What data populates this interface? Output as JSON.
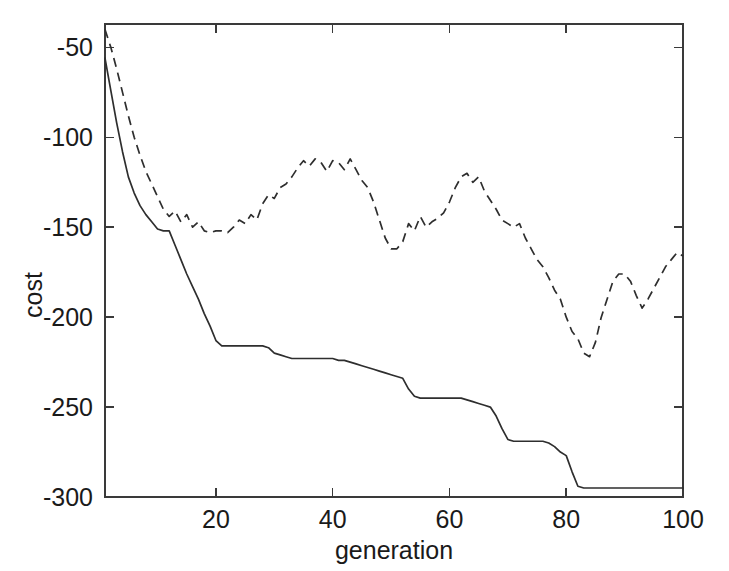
{
  "chart_data": {
    "type": "line",
    "title": "",
    "xlabel": "generation",
    "ylabel": "cost",
    "xlim": [
      1,
      100
    ],
    "ylim": [
      -300,
      -37
    ],
    "grid": false,
    "legend": "none",
    "xticks": [
      20,
      40,
      60,
      80,
      100
    ],
    "xticklabels": [
      "20",
      "40",
      "60",
      "80",
      "100"
    ],
    "yticks": [
      -50,
      -100,
      -150,
      -200,
      -250,
      -300
    ],
    "yticklabels": [
      "-50",
      "-100",
      "-150",
      "-200",
      "-250",
      "-300"
    ],
    "series": [
      {
        "name": "best cost",
        "style": "solid",
        "x": [
          1,
          2,
          3,
          4,
          5,
          6,
          7,
          8,
          9,
          10,
          11,
          12,
          13,
          14,
          15,
          16,
          17,
          18,
          19,
          20,
          21,
          22,
          23,
          24,
          25,
          26,
          27,
          28,
          29,
          30,
          31,
          32,
          33,
          34,
          35,
          36,
          37,
          38,
          39,
          40,
          41,
          42,
          43,
          44,
          45,
          46,
          47,
          48,
          49,
          50,
          51,
          52,
          53,
          54,
          55,
          56,
          57,
          58,
          59,
          60,
          61,
          62,
          63,
          64,
          65,
          66,
          67,
          68,
          69,
          70,
          71,
          72,
          73,
          74,
          75,
          76,
          77,
          78,
          79,
          80,
          81,
          82,
          83,
          84,
          85,
          86,
          87,
          88,
          89,
          90,
          91,
          92,
          93,
          94,
          95,
          96,
          97,
          98,
          99,
          100
        ],
        "y": [
          -56,
          -74,
          -92,
          -108,
          -122,
          -131,
          -138,
          -143,
          -147,
          -151,
          -152,
          -152,
          -160,
          -168,
          -176,
          -183,
          -190,
          -198,
          -205,
          -213,
          -216,
          -216,
          -216,
          -216,
          -216,
          -216,
          -216,
          -216,
          -217,
          -220,
          -221,
          -222,
          -223,
          -223,
          -223,
          -223,
          -223,
          -223,
          -223,
          -223,
          -224,
          -224,
          -225,
          -226,
          -227,
          -228,
          -229,
          -230,
          -231,
          -232,
          -233,
          -234,
          -240,
          -244,
          -245,
          -245,
          -245,
          -245,
          -245,
          -245,
          -245,
          -245,
          -246,
          -247,
          -248,
          -249,
          -250,
          -255,
          -262,
          -268,
          -269,
          -269,
          -269,
          -269,
          -269,
          -269,
          -270,
          -272,
          -275,
          -277,
          -286,
          -294,
          -295,
          -295,
          -295,
          -295,
          -295,
          -295,
          -295,
          -295,
          -295,
          -295,
          -295,
          -295,
          -295,
          -295,
          -295,
          -295,
          -295,
          -295
        ]
      },
      {
        "name": "average cost",
        "style": "dashed",
        "x": [
          1,
          2,
          3,
          4,
          5,
          6,
          7,
          8,
          9,
          10,
          11,
          12,
          13,
          14,
          15,
          16,
          17,
          18,
          19,
          20,
          21,
          22,
          23,
          24,
          25,
          26,
          27,
          28,
          29,
          30,
          31,
          32,
          33,
          34,
          35,
          36,
          37,
          38,
          39,
          40,
          41,
          42,
          43,
          44,
          45,
          46,
          47,
          48,
          49,
          50,
          51,
          52,
          53,
          54,
          55,
          56,
          57,
          58,
          59,
          60,
          61,
          62,
          63,
          64,
          65,
          66,
          67,
          68,
          69,
          70,
          71,
          72,
          73,
          74,
          75,
          76,
          77,
          78,
          79,
          80,
          81,
          82,
          83,
          84,
          85,
          86,
          87,
          88,
          89,
          90,
          91,
          92,
          93,
          94,
          95,
          96,
          97,
          98,
          99,
          100
        ],
        "y": [
          -40,
          -50,
          -62,
          -75,
          -88,
          -100,
          -110,
          -119,
          -126,
          -133,
          -140,
          -144,
          -141,
          -147,
          -143,
          -150,
          -147,
          -152,
          -153,
          -152,
          -152,
          -153,
          -150,
          -146,
          -148,
          -143,
          -146,
          -137,
          -132,
          -134,
          -128,
          -126,
          -122,
          -117,
          -113,
          -116,
          -112,
          -114,
          -119,
          -113,
          -114,
          -118,
          -112,
          -118,
          -124,
          -128,
          -136,
          -146,
          -156,
          -162,
          -162,
          -158,
          -148,
          -152,
          -144,
          -150,
          -147,
          -145,
          -142,
          -136,
          -128,
          -122,
          -120,
          -125,
          -122,
          -130,
          -135,
          -140,
          -146,
          -148,
          -150,
          -148,
          -156,
          -162,
          -168,
          -172,
          -178,
          -185,
          -190,
          -200,
          -208,
          -212,
          -220,
          -222,
          -214,
          -200,
          -190,
          -180,
          -176,
          -176,
          -180,
          -188,
          -195,
          -190,
          -184,
          -178,
          -172,
          -168,
          -164,
          -166
        ]
      }
    ]
  },
  "axis": {
    "ylabel_text": "cost",
    "xlabel_text": "generation"
  }
}
